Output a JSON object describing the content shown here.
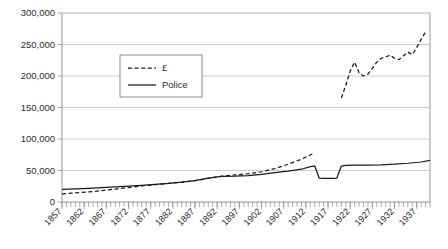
{
  "chart_data": {
    "type": "line",
    "title": "",
    "subtitle": "",
    "xlabel": "",
    "ylabel": "",
    "xlim": [
      1857,
      1940
    ],
    "ylim": [
      0,
      300000
    ],
    "grid": true,
    "legend_position": "upper-left-center",
    "y_ticks": [
      0,
      50000,
      100000,
      150000,
      200000,
      250000,
      300000
    ],
    "y_tick_labels": [
      "0",
      "50,000",
      "100,000",
      "150,000",
      "200,000",
      "250,000",
      "300,000"
    ],
    "x_tick_labels": [
      "1857",
      "1862",
      "1867",
      "1872",
      "1877",
      "1882",
      "1887",
      "1892",
      "1897",
      "1902",
      "1907",
      "1912",
      "1917",
      "1922",
      "1927",
      "1932",
      "1937"
    ],
    "x_tick_years": [
      1857,
      1862,
      1867,
      1872,
      1877,
      1882,
      1887,
      1892,
      1897,
      1902,
      1907,
      1912,
      1917,
      1922,
      1927,
      1932,
      1937
    ],
    "x_minor_tick_step": 1,
    "series": [
      {
        "name": "£",
        "style": "dashed",
        "color": "#1a1a1a",
        "segments": [
          {
            "x": [
              1857,
              1860,
              1863,
              1866,
              1869,
              1872,
              1875,
              1878,
              1881,
              1884,
              1887,
              1890,
              1893,
              1896,
              1899,
              1902,
              1905,
              1908,
              1911,
              1914
            ],
            "y": [
              13000,
              14500,
              16000,
              18000,
              20500,
              23000,
              25500,
              27500,
              29500,
              31500,
              34000,
              37500,
              41000,
              43000,
              45000,
              48000,
              53000,
              60000,
              68000,
              78000
            ]
          },
          {
            "x": [
              1920,
              1921,
              1922,
              1923,
              1924,
              1925,
              1926,
              1927,
              1928,
              1929,
              1930,
              1931,
              1932,
              1933,
              1934,
              1935,
              1936,
              1937,
              1938,
              1939
            ],
            "y": [
              165000,
              185000,
              208000,
              222000,
              205000,
              200000,
              203000,
              212000,
              222000,
              228000,
              230000,
              233000,
              228000,
              226000,
              232000,
              238000,
              234000,
              245000,
              258000,
              270000
            ]
          }
        ]
      },
      {
        "name": "Police",
        "style": "solid",
        "color": "#1a1a1a",
        "segments": [
          {
            "x": [
              1857,
              1860,
              1863,
              1866,
              1869,
              1872,
              1875,
              1878,
              1881,
              1884,
              1887,
              1890,
              1893,
              1896,
              1899,
              1902,
              1905,
              1908,
              1911,
              1913,
              1914,
              1915,
              1916,
              1917,
              1918,
              1919,
              1920,
              1921,
              1923,
              1926,
              1929,
              1932,
              1935,
              1938,
              1940
            ],
            "y": [
              20000,
              20800,
              21800,
              22800,
              24000,
              25200,
              26500,
              28000,
              29500,
              31500,
              34000,
              38000,
              40500,
              41000,
              42000,
              44000,
              46500,
              49000,
              52000,
              56000,
              57000,
              38000,
              37500,
              37500,
              37500,
              38000,
              57000,
              58000,
              58500,
              58500,
              59000,
              60000,
              61500,
              63500,
              66000
            ]
          }
        ]
      }
    ]
  },
  "legend": {
    "entries": [
      {
        "label": "£",
        "style": "dashed"
      },
      {
        "label": "Police",
        "style": "solid"
      }
    ]
  }
}
